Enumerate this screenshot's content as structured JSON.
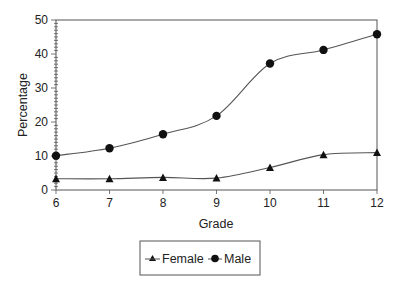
{
  "chart_data": {
    "type": "line",
    "title": "",
    "xlabel": "Grade",
    "ylabel": "Percentage",
    "x": [
      6,
      7,
      8,
      9,
      10,
      11,
      12
    ],
    "categories": [
      "6",
      "7",
      "8",
      "9",
      "10",
      "11",
      "12"
    ],
    "series": [
      {
        "name": "Female",
        "marker": "triangle",
        "values": [
          3.3,
          3.3,
          3.7,
          3.5,
          6.6,
          10.4,
          11.0
        ]
      },
      {
        "name": "Male",
        "marker": "circle",
        "values": [
          10.1,
          12.3,
          16.4,
          21.8,
          37.2,
          41.2,
          45.8
        ]
      }
    ],
    "ylim": [
      0,
      50
    ],
    "xlim": [
      6,
      12
    ],
    "yticks": [
      0,
      10,
      20,
      30,
      40,
      50
    ],
    "xticks": [
      "6",
      "7",
      "8",
      "9",
      "10",
      "11",
      "12"
    ],
    "grid": false,
    "smoothed": true,
    "legend_position": "bottom-center"
  },
  "colors": {
    "line": "#555555",
    "marker": "#111111",
    "axis": "#555555",
    "text": "#222222",
    "background": "#ffffff"
  }
}
